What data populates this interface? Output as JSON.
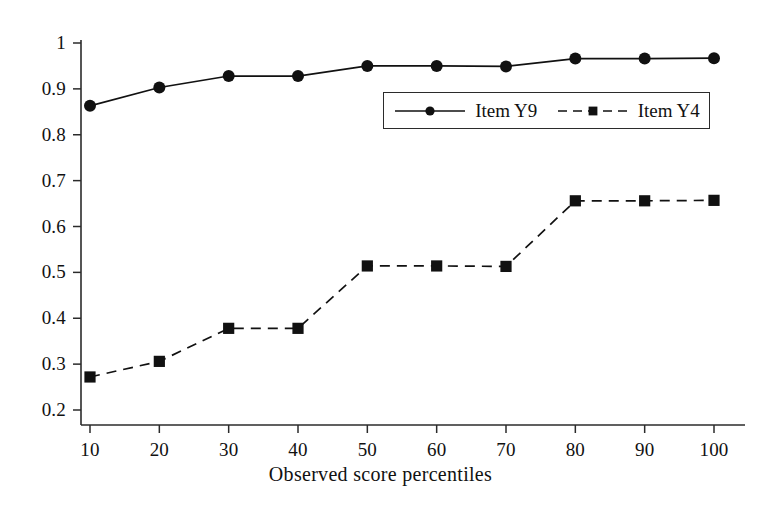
{
  "chart_data": {
    "type": "line",
    "title": "",
    "xlabel": "Observed score percentiles",
    "ylabel": "",
    "x": [
      10,
      20,
      30,
      40,
      50,
      60,
      70,
      80,
      90,
      100
    ],
    "xticklabels": [
      "10",
      "20",
      "30",
      "40",
      "50",
      "60",
      "70",
      "80",
      "90",
      "100"
    ],
    "yticklabels": [
      "0.2",
      "0.3",
      "0.4",
      "0.5",
      "0.6",
      "0.7",
      "0.8",
      "0.9",
      "1"
    ],
    "yticks": [
      0.2,
      0.3,
      0.4,
      0.5,
      0.6,
      0.7,
      0.8,
      0.9,
      1
    ],
    "xlim": [
      10,
      100
    ],
    "ylim": [
      0.2,
      1.0
    ],
    "grid": false,
    "legend_position": "upper center",
    "series": [
      {
        "name": "Item Y9",
        "marker": "circle",
        "linestyle": "solid",
        "color": "#111111",
        "values": [
          0.863,
          0.903,
          0.928,
          0.928,
          0.95,
          0.95,
          0.949,
          0.966,
          0.966,
          0.967
        ]
      },
      {
        "name": "Item Y4",
        "marker": "square",
        "linestyle": "dashed",
        "color": "#111111",
        "values": [
          0.272,
          0.306,
          0.378,
          0.378,
          0.514,
          0.514,
          0.513,
          0.656,
          0.656,
          0.657
        ]
      }
    ]
  },
  "axes": {
    "x_axis_name": "x-axis",
    "y_axis_name": "y-axis"
  },
  "legend": {
    "entries": [
      {
        "label": "Item Y9",
        "marker": "circle-marker",
        "line": "solid-line"
      },
      {
        "label": "Item Y4",
        "marker": "square-marker",
        "line": "dashed-line"
      }
    ]
  }
}
